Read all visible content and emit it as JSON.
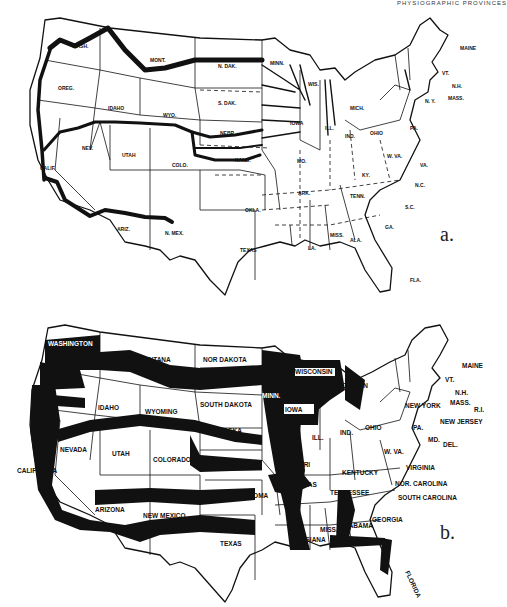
{
  "header": {
    "running_head": "PHYSIOGRAPHIC PROVINCES"
  },
  "figure": {
    "panels": [
      {
        "id": "a",
        "letter": "a.",
        "description": "Outline map of the United States with abbreviated state names; thick lines trace east-west routes and river systems in the Midwest",
        "state_labels": {
          "wash": "WASH.",
          "ore": "OREG.",
          "idaho": "IDAHO",
          "mont": "MONT.",
          "ndak": "N. DAK.",
          "sdak": "S. DAK.",
          "wyo": "WYO.",
          "nebr": "NEBR.",
          "nev": "NEV.",
          "utah": "UTAH",
          "colo": "COLO.",
          "kans": "KANS.",
          "calif": "CALIF.",
          "ariz": "ARIZ.",
          "nmex": "N. MEX.",
          "okla": "OKLA.",
          "texas": "TEXAS",
          "minn": "MINN.",
          "wis": "WIS.",
          "iowa": "IOWA",
          "mo": "MO.",
          "ark": "ARK.",
          "la": "LA.",
          "ill": "ILL.",
          "mich": "MICH.",
          "ind": "IND.",
          "ohio": "OHIO",
          "ky": "KY.",
          "tenn": "TENN.",
          "miss": "MISS.",
          "ala": "ALA.",
          "ga": "GA.",
          "fla": "FLA.",
          "sc": "S.C.",
          "nc": "N.C.",
          "va": "VA.",
          "wva": "W. VA.",
          "pa": "PA.",
          "ny": "N. Y.",
          "vt": "VT.",
          "nh": "N.H.",
          "maine": "MAINE",
          "mass": "MASS.",
          "md": "MD."
        }
      },
      {
        "id": "b",
        "letter": "b.",
        "description": "Outline map of the United States with full state names; broad black bands mark regions across the West, Plains, and Mississippi valley",
        "state_labels": {
          "wash": "WASHINGTON",
          "ore": "OREGON",
          "idaho": "IDAHO",
          "mont": "MONTANA",
          "ndak": "NOR DAKOTA",
          "sdak": "SOUTH DAKOTA",
          "wyo": "WYOMING",
          "nebr": "NEBRASKA",
          "nev": "NEVADA",
          "utah": "UTAH",
          "colo": "COLORADO",
          "kans": "KANSAS",
          "calif": "CALIFORNIA",
          "ariz": "ARIZONA",
          "nmex": "NEW MEXICO",
          "okla": "OKLAHOMA",
          "texas": "TEXAS",
          "minn": "MINN.",
          "wis": "WISCONSIN",
          "iowa": "IOWA",
          "mo": "MISSOURI",
          "ark": "ARKANSAS",
          "la": "LOUISIANA",
          "ill": "ILL.",
          "mich": "MICHIGAN",
          "ind": "IND.",
          "ohio": "OHIO",
          "ky": "KENTUCKY",
          "tenn": "TENNESSEE",
          "miss": "MISS.",
          "ala": "ALABAMA",
          "ga": "GEORGIA",
          "fla": "FLORIDA",
          "sc": "SOUTH CAROLINA",
          "nc": "NOR. CAROLINA",
          "va": "VIRGINIA",
          "wva": "W. VA.",
          "pa": "PA.",
          "ny": "NEW YORK",
          "vt": "VT.",
          "nh": "N.H.",
          "maine": "MAINE",
          "mass": "MASS.",
          "nj": "NEW JERSEY",
          "md": "MD.",
          "del": "DEL.",
          "ri": "R.I."
        }
      }
    ]
  }
}
